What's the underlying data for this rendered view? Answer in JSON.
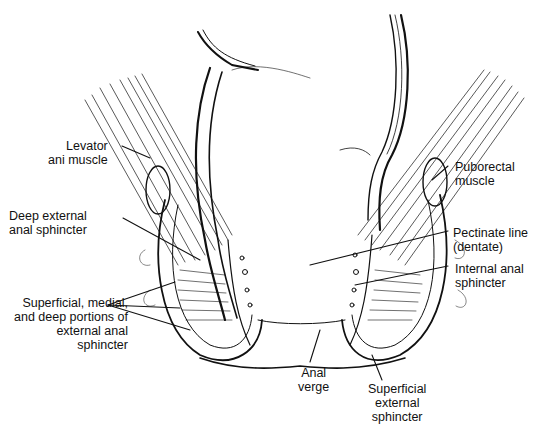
{
  "figure": {
    "labels": {
      "levator": {
        "line1": "Levator",
        "line2": "ani muscle"
      },
      "deep_external": {
        "line1": "Deep external",
        "line2": "anal sphincter"
      },
      "portions": {
        "line1": "Superficial, medial,",
        "line2": "and deep portions of",
        "line3": "external anal",
        "line4": "sphincter"
      },
      "puborectal": {
        "line1": "Puborectal",
        "line2": "muscle"
      },
      "pectinate": {
        "line1": "Pectinate line",
        "line2": "(dentate)"
      },
      "internal": {
        "line1": "Internal anal",
        "line2": "sphincter"
      },
      "anal_verge": {
        "line1": "Anal",
        "line2": "verge"
      },
      "superficial_external": {
        "line1": "Superficial",
        "line2": "external",
        "line3": "sphincter"
      }
    }
  }
}
